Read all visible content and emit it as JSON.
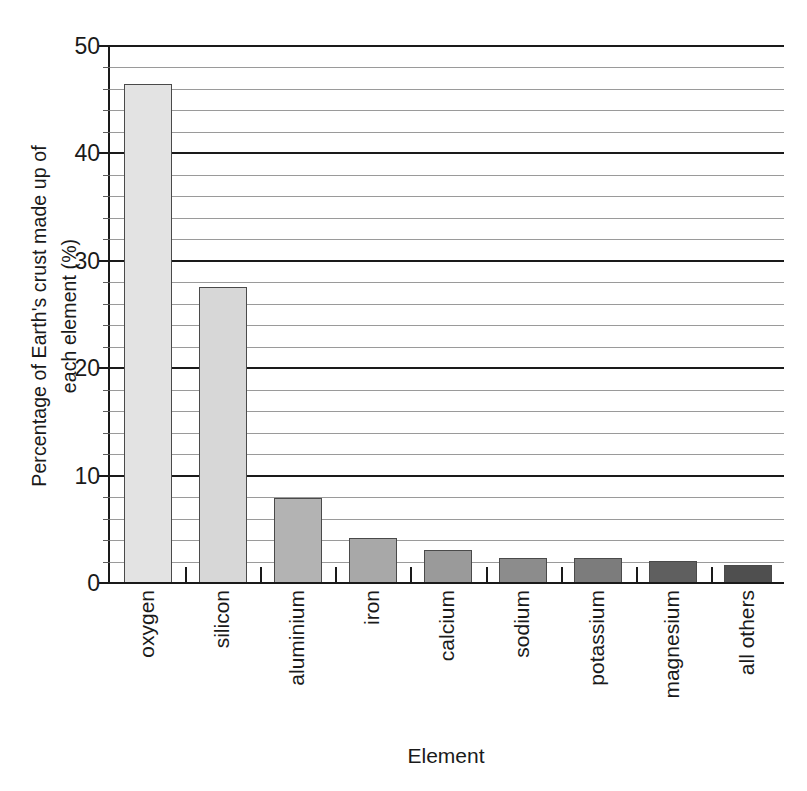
{
  "chart_data": {
    "type": "bar",
    "title": "",
    "xlabel": "Element",
    "ylabel": "Percentage of Earth's crust made up of each element (%)",
    "ylabel_line1": "Percentage of Earth's crust made up of",
    "ylabel_line2": "each element (%)",
    "categories": [
      "oxygen",
      "silicon",
      "aluminium",
      "iron",
      "calcium",
      "sodium",
      "potassium",
      "magnesium",
      "all others"
    ],
    "values": [
      46.6,
      27.7,
      8.0,
      4.3,
      3.2,
      2.4,
      2.4,
      2.1,
      1.8
    ],
    "ylim": [
      0,
      50
    ],
    "xlim_note": "categorical",
    "ytick_labels": [
      "0",
      "10",
      "20",
      "30",
      "40",
      "50"
    ],
    "ytick_values": [
      0,
      10,
      20,
      30,
      40,
      50
    ],
    "minor_tick_step": 2,
    "grid": "horizontal-major-and-minor",
    "legend": "none",
    "bar_colors": [
      "#e3e3e3",
      "#d7d7d7",
      "#b3b3b3",
      "#a8a8a8",
      "#9a9a9a",
      "#8c8c8c",
      "#7c7c7c",
      "#5f5f5f",
      "#4f4f4f"
    ],
    "bar_edge_color": "#4a4a4a",
    "axis_color": "#1a1a1a",
    "minor_grid_color": "#9a9a9a",
    "background": "#ffffff"
  }
}
